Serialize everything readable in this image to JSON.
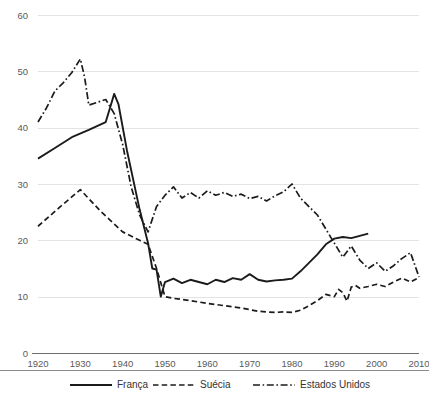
{
  "chart_data": {
    "type": "line",
    "title": "",
    "subtitle": "",
    "xlabel": "",
    "ylabel": "",
    "xlim": [
      1920,
      2010
    ],
    "ylim": [
      0,
      60
    ],
    "grid": true,
    "legend_position": "bottom",
    "yticks": [
      0,
      10,
      20,
      30,
      40,
      50,
      60
    ],
    "xticks": [
      1920,
      1930,
      1940,
      1950,
      1960,
      1970,
      1980,
      1990,
      2000,
      2010
    ],
    "ytick_labels": [
      "0",
      "10",
      "20",
      "30",
      "40",
      "50",
      "60"
    ],
    "xtick_labels": [
      "1920",
      "1930",
      "1940",
      "1950",
      "1960",
      "1970",
      "1980",
      "1990",
      "2000",
      "2010"
    ],
    "series": [
      {
        "name": "França",
        "style": "solid",
        "color": "#1b1b1b",
        "x": [
          1920,
          1924,
          1928,
          1932,
          1936,
          1937,
          1938,
          1939,
          1941,
          1944,
          1946,
          1947,
          1948,
          1949,
          1950,
          1952,
          1954,
          1956,
          1958,
          1960,
          1962,
          1964,
          1966,
          1968,
          1970,
          1972,
          1974,
          1976,
          1978,
          1980,
          1982,
          1984,
          1986,
          1988,
          1990,
          1992,
          1994,
          1996,
          1998
        ],
        "y": [
          34.5,
          36.4,
          38.3,
          39.6,
          41.0,
          43.5,
          46.0,
          44.2,
          36.0,
          25.5,
          19.5,
          15.0,
          14.8,
          10.0,
          12.6,
          13.2,
          12.4,
          13.0,
          12.6,
          12.2,
          13.0,
          12.6,
          13.3,
          13.0,
          14.0,
          13.0,
          12.7,
          12.9,
          13.0,
          13.2,
          14.5,
          16.0,
          17.5,
          19.3,
          20.3,
          20.6,
          20.4,
          20.8,
          21.2
        ]
      },
      {
        "name": "Suécia",
        "style": "dashed",
        "color": "#1b1b1b",
        "x": [
          1920,
          1925,
          1930,
          1935,
          1940,
          1944,
          1946,
          1948,
          1950,
          1952,
          1956,
          1960,
          1964,
          1968,
          1972,
          1976,
          1978,
          1980,
          1982,
          1984,
          1986,
          1988,
          1990,
          1991,
          1992,
          1993,
          1994,
          1995,
          1996,
          1998,
          2000,
          2002,
          2004,
          2006,
          2008,
          2010
        ],
        "y": [
          22.5,
          25.8,
          29.0,
          25.0,
          21.5,
          20.0,
          19.3,
          15.0,
          10.0,
          9.7,
          9.3,
          8.8,
          8.4,
          8.0,
          7.4,
          7.2,
          7.3,
          7.2,
          7.6,
          8.4,
          9.3,
          10.4,
          10.0,
          11.3,
          10.7,
          9.2,
          11.7,
          12.0,
          11.5,
          11.8,
          12.2,
          11.8,
          12.6,
          13.3,
          12.6,
          13.4
        ]
      },
      {
        "name": "Estados Unidos",
        "style": "dashdot",
        "color": "#1b1b1b",
        "x": [
          1920,
          1922,
          1924,
          1926,
          1928,
          1929,
          1930,
          1931,
          1932,
          1934,
          1936,
          1938,
          1940,
          1942,
          1944,
          1946,
          1948,
          1950,
          1952,
          1954,
          1956,
          1958,
          1960,
          1962,
          1964,
          1966,
          1968,
          1970,
          1972,
          1974,
          1976,
          1978,
          1980,
          1982,
          1984,
          1986,
          1988,
          1990,
          1992,
          1994,
          1996,
          1998,
          2000,
          2002,
          2004,
          2006,
          2008,
          2010
        ],
        "y": [
          41.0,
          43.5,
          46.5,
          48.0,
          49.8,
          51.0,
          52.2,
          49.0,
          44.0,
          44.5,
          45.0,
          42.5,
          37.0,
          29.5,
          24.5,
          21.5,
          26.0,
          28.0,
          29.5,
          27.5,
          28.5,
          27.5,
          28.8,
          28.0,
          28.5,
          27.8,
          28.2,
          27.4,
          27.8,
          27.0,
          27.9,
          28.6,
          30.0,
          27.5,
          26.0,
          24.5,
          22.0,
          19.5,
          17.0,
          19.0,
          16.5,
          15.0,
          16.0,
          14.5,
          15.5,
          16.8,
          17.8,
          13.5
        ]
      }
    ]
  },
  "legend": {
    "items": [
      {
        "label": "França",
        "style": "solid"
      },
      {
        "label": "Suécia",
        "style": "dashed"
      },
      {
        "label": "Estados Unidos",
        "style": "dashdot"
      }
    ]
  }
}
